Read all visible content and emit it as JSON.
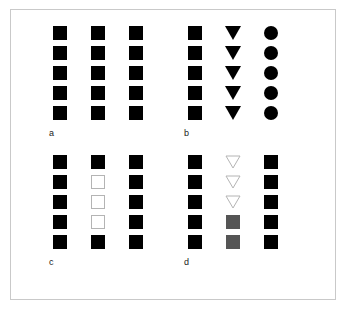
{
  "figure": {
    "background_color": "#ffffff",
    "frame_color": "#c9c9c9",
    "colors": {
      "filled": "#000000",
      "open_fill": "#ffffff",
      "open_stroke": "#b4b4b4",
      "gray": "#555555",
      "label_text": "#1a1a1a"
    },
    "panels": [
      {
        "id": "a",
        "label": "a",
        "columns": [
          {
            "name": "column-1",
            "glyphs": [
              {
                "shape": "square",
                "fill": "filled"
              },
              {
                "shape": "square",
                "fill": "filled"
              },
              {
                "shape": "square",
                "fill": "filled"
              },
              {
                "shape": "square",
                "fill": "filled"
              },
              {
                "shape": "square",
                "fill": "filled"
              }
            ]
          },
          {
            "name": "column-2",
            "glyphs": [
              {
                "shape": "square",
                "fill": "filled"
              },
              {
                "shape": "square",
                "fill": "filled"
              },
              {
                "shape": "square",
                "fill": "filled"
              },
              {
                "shape": "square",
                "fill": "filled"
              },
              {
                "shape": "square",
                "fill": "filled"
              }
            ]
          },
          {
            "name": "column-3",
            "glyphs": [
              {
                "shape": "square",
                "fill": "filled"
              },
              {
                "shape": "square",
                "fill": "filled"
              },
              {
                "shape": "square",
                "fill": "filled"
              },
              {
                "shape": "square",
                "fill": "filled"
              },
              {
                "shape": "square",
                "fill": "filled"
              }
            ]
          }
        ]
      },
      {
        "id": "b",
        "label": "b",
        "columns": [
          {
            "name": "column-1",
            "glyphs": [
              {
                "shape": "square",
                "fill": "filled"
              },
              {
                "shape": "square",
                "fill": "filled"
              },
              {
                "shape": "square",
                "fill": "filled"
              },
              {
                "shape": "square",
                "fill": "filled"
              },
              {
                "shape": "square",
                "fill": "filled"
              }
            ]
          },
          {
            "name": "column-2",
            "glyphs": [
              {
                "shape": "triangle-down",
                "fill": "filled"
              },
              {
                "shape": "triangle-down",
                "fill": "filled"
              },
              {
                "shape": "triangle-down",
                "fill": "filled"
              },
              {
                "shape": "triangle-down",
                "fill": "filled"
              },
              {
                "shape": "triangle-down",
                "fill": "filled"
              }
            ]
          },
          {
            "name": "column-3",
            "glyphs": [
              {
                "shape": "circle",
                "fill": "filled"
              },
              {
                "shape": "circle",
                "fill": "filled"
              },
              {
                "shape": "circle",
                "fill": "filled"
              },
              {
                "shape": "circle",
                "fill": "filled"
              },
              {
                "shape": "circle",
                "fill": "filled"
              }
            ]
          }
        ]
      },
      {
        "id": "c",
        "label": "c",
        "columns": [
          {
            "name": "column-1",
            "glyphs": [
              {
                "shape": "square",
                "fill": "filled"
              },
              {
                "shape": "square",
                "fill": "filled"
              },
              {
                "shape": "square",
                "fill": "filled"
              },
              {
                "shape": "square",
                "fill": "filled"
              },
              {
                "shape": "square",
                "fill": "filled"
              }
            ]
          },
          {
            "name": "column-2",
            "glyphs": [
              {
                "shape": "square",
                "fill": "filled"
              },
              {
                "shape": "square",
                "fill": "open"
              },
              {
                "shape": "square",
                "fill": "open"
              },
              {
                "shape": "square",
                "fill": "open"
              },
              {
                "shape": "square",
                "fill": "filled"
              }
            ]
          },
          {
            "name": "column-3",
            "glyphs": [
              {
                "shape": "square",
                "fill": "filled"
              },
              {
                "shape": "square",
                "fill": "filled"
              },
              {
                "shape": "square",
                "fill": "filled"
              },
              {
                "shape": "square",
                "fill": "filled"
              },
              {
                "shape": "square",
                "fill": "filled"
              }
            ]
          }
        ]
      },
      {
        "id": "d",
        "label": "d",
        "columns": [
          {
            "name": "column-1",
            "glyphs": [
              {
                "shape": "square",
                "fill": "filled"
              },
              {
                "shape": "square",
                "fill": "filled"
              },
              {
                "shape": "square",
                "fill": "filled"
              },
              {
                "shape": "square",
                "fill": "filled"
              },
              {
                "shape": "square",
                "fill": "filled"
              }
            ]
          },
          {
            "name": "column-2",
            "glyphs": [
              {
                "shape": "triangle-down",
                "fill": "open"
              },
              {
                "shape": "triangle-down",
                "fill": "open"
              },
              {
                "shape": "triangle-down",
                "fill": "open"
              },
              {
                "shape": "square",
                "fill": "gray"
              },
              {
                "shape": "square",
                "fill": "gray"
              }
            ]
          },
          {
            "name": "column-3",
            "glyphs": [
              {
                "shape": "square",
                "fill": "filled"
              },
              {
                "shape": "square",
                "fill": "filled"
              },
              {
                "shape": "square",
                "fill": "filled"
              },
              {
                "shape": "square",
                "fill": "filled"
              },
              {
                "shape": "square",
                "fill": "filled"
              }
            ]
          }
        ]
      }
    ]
  }
}
